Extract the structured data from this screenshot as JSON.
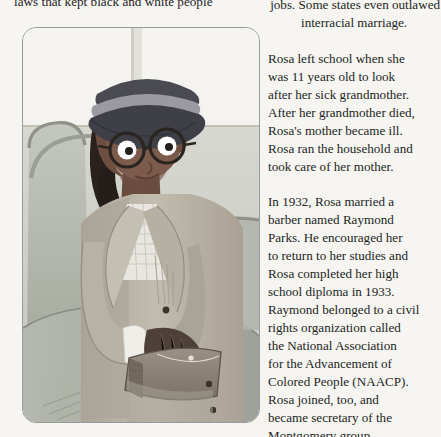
{
  "page": {
    "background_color": "#f6f5f1",
    "text_color": "#231f1d"
  },
  "top_running_text": {
    "clipped_line": "laws that kept black and white people"
  },
  "illustration": {
    "caption_alt": "Rosa Parks seated on a bus holding a handbag",
    "panel_border_color": "#9a9a98",
    "colors": {
      "window_light": "#f4f3ef",
      "bus_wall": "#cfd0c9",
      "seat_back": "#b9bdb3",
      "seat_front": "#a8aca1",
      "seat_rail": "#8e9288",
      "skin": "#7c5b4c",
      "skin_shadow": "#6a4c3f",
      "hair": "#2a211d",
      "hat_dark": "#4a4a52",
      "hat_band": "#9b9aa2",
      "coat": "#b9b3a6",
      "coat_shadow": "#a39d90",
      "blouse": "#e8e6df",
      "cuff": "#efeee8",
      "purse": "#8d8378",
      "purse_dark": "#6f665c",
      "glasses_frame": "#2b2520",
      "eye_white": "#ffffff",
      "pupil": "#241f1b"
    }
  },
  "body_text": {
    "paragraphs": [
      {
        "id": "p-outlawed",
        "lines": [
          {
            "text": "same jobs. Some states even outlawed",
            "style": "lead-out"
          },
          {
            "text": "interracial marriage.",
            "style": "indent-1"
          }
        ]
      },
      {
        "id": "p-school",
        "lines": [
          {
            "text": "Rosa left school when she",
            "style": ""
          },
          {
            "text": "was 11 years old to look",
            "style": ""
          },
          {
            "text": "after her sick grandmother.",
            "style": ""
          },
          {
            "text": "After her grandmother died,",
            "style": ""
          },
          {
            "text": "Rosa's mother became ill.",
            "style": ""
          },
          {
            "text": "Rosa ran the household and",
            "style": ""
          },
          {
            "text": "took care of her mother.",
            "style": ""
          }
        ]
      },
      {
        "id": "p-marriage",
        "lines": [
          {
            "text": "In 1932, Rosa married a",
            "style": ""
          },
          {
            "text": "barber named Raymond",
            "style": ""
          },
          {
            "text": "Parks. He encouraged her",
            "style": ""
          },
          {
            "text": "to return to her studies and",
            "style": ""
          },
          {
            "text": "Rosa completed her high",
            "style": ""
          },
          {
            "text": "school diploma in 1933.",
            "style": ""
          },
          {
            "text": "Raymond belonged to a civil",
            "style": ""
          },
          {
            "text": "rights organization called",
            "style": ""
          },
          {
            "text": "the National Association",
            "style": ""
          },
          {
            "text": "for the Advancement of",
            "style": ""
          },
          {
            "text": "Colored People (NAACP).",
            "style": ""
          },
          {
            "text": "Rosa joined, too, and",
            "style": ""
          },
          {
            "text": "became secretary of the",
            "style": ""
          },
          {
            "text": "Montgomery group.",
            "style": ""
          }
        ]
      }
    ]
  }
}
